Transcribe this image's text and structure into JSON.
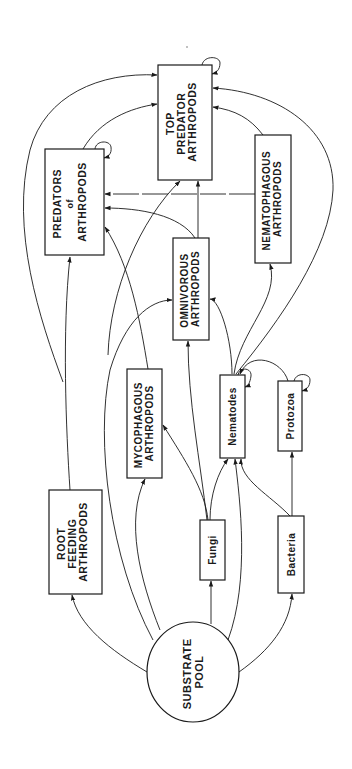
{
  "diagram": {
    "type": "soil food web",
    "orientation": "rotated 90deg (text reads bottom-to-top)",
    "nodes": {
      "top_predator": {
        "lines": [
          "TOP",
          "PREDATOR",
          "ARTHROPODS"
        ]
      },
      "predators": {
        "lines": [
          "PREDATORS",
          "of",
          "ARTHROPODS"
        ]
      },
      "nematophagous": {
        "lines": [
          "NEMATOPHAGOUS",
          "ARTHROPODS"
        ]
      },
      "omnivorous": {
        "lines": [
          "OMNIVOROUS",
          "ARTHROPODS"
        ]
      },
      "mycophagous": {
        "lines": [
          "MYCOPHAGOUS",
          "ARTHROPODS"
        ]
      },
      "root_feeding": {
        "lines": [
          "ROOT",
          "FEEDING",
          "ARTHROPODS"
        ]
      },
      "nematodes": {
        "lines": [
          "Nematodes"
        ]
      },
      "protozoa": {
        "lines": [
          "Protozoa"
        ]
      },
      "fungi": {
        "lines": [
          "Fungi"
        ]
      },
      "bacteria": {
        "lines": [
          "Bacteria"
        ]
      },
      "substrate": {
        "lines": [
          "SUBSTRATE",
          "POOL"
        ]
      }
    },
    "edges": [
      {
        "from": "SUBSTRATE POOL",
        "to": "ROOT FEEDING ARTHROPODS"
      },
      {
        "from": "SUBSTRATE POOL",
        "to": "MYCOPHAGOUS ARTHROPODS"
      },
      {
        "from": "SUBSTRATE POOL",
        "to": "OMNIVOROUS ARTHROPODS"
      },
      {
        "from": "SUBSTRATE POOL",
        "to": "Fungi"
      },
      {
        "from": "SUBSTRATE POOL",
        "to": "Nematodes"
      },
      {
        "from": "SUBSTRATE POOL",
        "to": "Bacteria"
      },
      {
        "from": "Fungi",
        "to": "MYCOPHAGOUS ARTHROPODS"
      },
      {
        "from": "Fungi",
        "to": "Nematodes"
      },
      {
        "from": "Fungi",
        "to": "OMNIVOROUS ARTHROPODS"
      },
      {
        "from": "Bacteria",
        "to": "Protozoa"
      },
      {
        "from": "Bacteria",
        "to": "Nematodes"
      },
      {
        "from": "Protozoa",
        "to": "Nematodes"
      },
      {
        "from": "Protozoa",
        "to": "Protozoa",
        "self": true
      },
      {
        "from": "Nematodes",
        "to": "Nematodes",
        "self": true
      },
      {
        "from": "Nematodes",
        "to": "OMNIVOROUS ARTHROPODS"
      },
      {
        "from": "Nematodes",
        "to": "NEMATOPHAGOUS ARTHROPODS"
      },
      {
        "from": "Nematodes",
        "to": "TOP PREDATOR ARTHROPODS"
      },
      {
        "from": "ROOT FEEDING ARTHROPODS",
        "to": "PREDATORS of ARTHROPODS"
      },
      {
        "from": "ROOT FEEDING ARTHROPODS",
        "to": "TOP PREDATOR ARTHROPODS"
      },
      {
        "from": "MYCOPHAGOUS ARTHROPODS",
        "to": "PREDATORS of ARTHROPODS"
      },
      {
        "from": "MYCOPHAGOUS ARTHROPODS",
        "to": "TOP PREDATOR ARTHROPODS"
      },
      {
        "from": "OMNIVOROUS ARTHROPODS",
        "to": "PREDATORS of ARTHROPODS"
      },
      {
        "from": "OMNIVOROUS ARTHROPODS",
        "to": "TOP PREDATOR ARTHROPODS"
      },
      {
        "from": "NEMATOPHAGOUS ARTHROPODS",
        "to": "PREDATORS of ARTHROPODS",
        "style": "dashed"
      },
      {
        "from": "NEMATOPHAGOUS ARTHROPODS",
        "to": "TOP PREDATOR ARTHROPODS"
      },
      {
        "from": "PREDATORS of ARTHROPODS",
        "to": "TOP PREDATOR ARTHROPODS"
      },
      {
        "from": "PREDATORS of ARTHROPODS",
        "to": "PREDATORS of ARTHROPODS",
        "self": true
      },
      {
        "from": "TOP PREDATOR ARTHROPODS",
        "to": "TOP PREDATOR ARTHROPODS",
        "self": true
      }
    ]
  }
}
